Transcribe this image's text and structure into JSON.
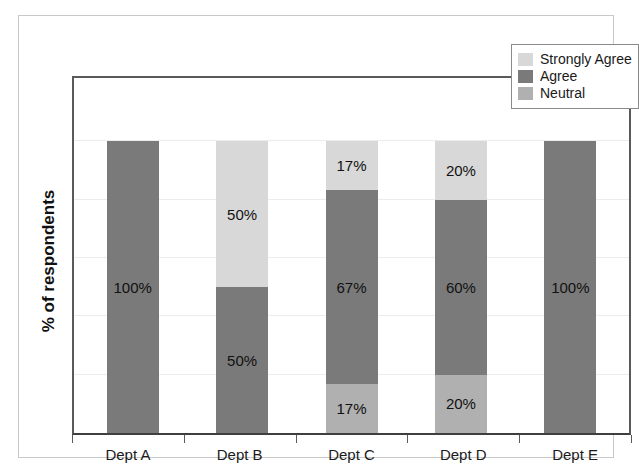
{
  "chart_data": {
    "type": "bar",
    "subtype": "stacked-100-percent",
    "title": "",
    "xlabel": "",
    "ylabel": "% of respondents",
    "ylim": [
      0,
      100
    ],
    "grid": true,
    "gridline_values": [
      20,
      40,
      60,
      80,
      100
    ],
    "y_tick_labels": [],
    "legend_position": "top-right",
    "stack_order_bottom_to_top": [
      "Neutral",
      "Agree",
      "Strongly Agree"
    ],
    "categories": [
      "Dept A",
      "Dept B",
      "Dept C",
      "Dept D",
      "Dept E"
    ],
    "series": [
      {
        "name": "Strongly Agree",
        "color": "#d8d8d8",
        "values": [
          0,
          50,
          17,
          20,
          0
        ],
        "labels": [
          "",
          "50%",
          "17%",
          "20%",
          ""
        ]
      },
      {
        "name": "Agree",
        "color": "#7a7a7a",
        "values": [
          100,
          50,
          67,
          60,
          100
        ],
        "labels": [
          "100%",
          "50%",
          "67%",
          "60%",
          "100%"
        ]
      },
      {
        "name": "Neutral",
        "color": "#b0b0b0",
        "values": [
          0,
          0,
          17,
          20,
          0
        ],
        "labels": [
          "",
          "",
          "17%",
          "20%",
          ""
        ]
      }
    ]
  },
  "legend": {
    "items": [
      {
        "label": "Strongly Agree",
        "color": "#d8d8d8"
      },
      {
        "label": "Agree",
        "color": "#7a7a7a"
      },
      {
        "label": "Neutral",
        "color": "#b0b0b0"
      }
    ]
  },
  "axes": {
    "y_title": "% of respondents"
  }
}
